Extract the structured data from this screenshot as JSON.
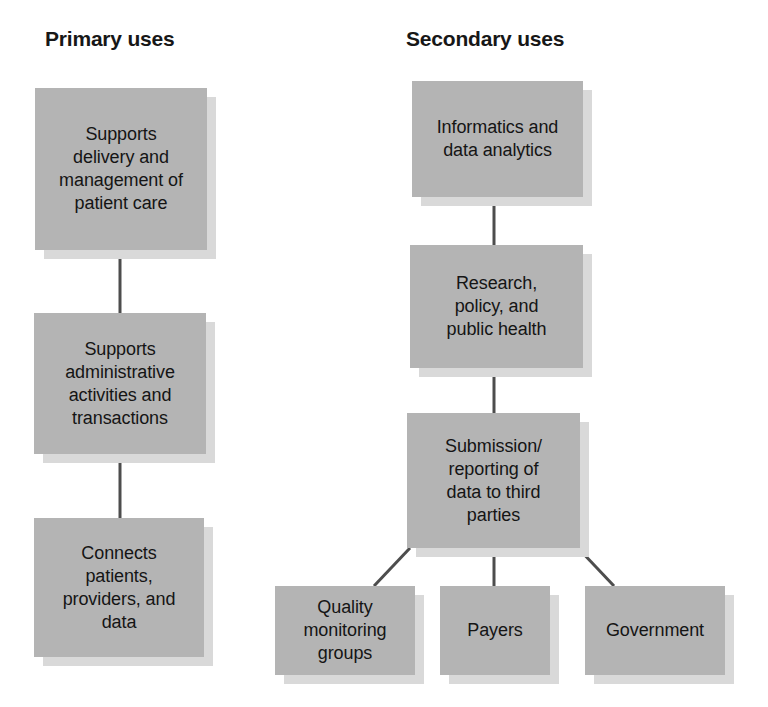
{
  "diagram": {
    "background_color": "#ffffff",
    "box_fill_color": "#b4b4b4",
    "box_shadow_color": "#d9d9d9",
    "connector_color": "#4d4d4d",
    "text_color": "#151515"
  },
  "columns": [
    {
      "id": "primary",
      "heading": "Primary uses",
      "nodes": [
        {
          "id": "primary-1",
          "label": "Supports\ndelivery and\nmanagement of\npatient care"
        },
        {
          "id": "primary-2",
          "label": "Supports\nadministrative\nactivities and\ntransactions"
        },
        {
          "id": "primary-3",
          "label": "Connects\npatients,\nproviders, and\ndata"
        }
      ]
    },
    {
      "id": "secondary",
      "heading": "Secondary uses",
      "nodes": [
        {
          "id": "secondary-1",
          "label": "Informatics and\ndata analytics"
        },
        {
          "id": "secondary-2",
          "label": "Research,\npolicy, and\npublic health"
        },
        {
          "id": "secondary-3",
          "label": "Submission/\nreporting of\ndata to third\nparties"
        }
      ],
      "leaves": [
        {
          "id": "leaf-quality",
          "label": "Quality\nmonitoring\ngroups"
        },
        {
          "id": "leaf-payers",
          "label": "Payers"
        },
        {
          "id": "leaf-government",
          "label": "Government"
        }
      ]
    }
  ]
}
